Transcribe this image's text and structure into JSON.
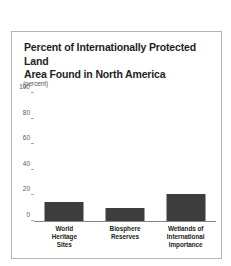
{
  "figure": {
    "title": "Percent of Internationally Protected Land\nArea Found in North America",
    "unit_label": "(percent)",
    "border_color": "#b4b4b4",
    "background_color": "#ffffff"
  },
  "chart_data": {
    "type": "bar",
    "title": "Percent of Internationally Protected Land Area Found in North America",
    "xlabel": "",
    "ylabel": "(percent)",
    "ylim": [
      0,
      100
    ],
    "yticks": [
      0,
      20,
      40,
      60,
      80,
      100
    ],
    "ytick_labels": [
      "0",
      "20",
      "40",
      "60",
      "80",
      "100"
    ],
    "grid": false,
    "legend": false,
    "bar_color": "#3d3d3d",
    "axis_color": "#808285",
    "categories": [
      "World\nHeritage\nSites",
      "Biosphere\nReserves",
      "Wetlands of\nInternational\nImportance"
    ],
    "category_names": [
      "World Heritage Sites",
      "Biosphere Reserves",
      "Wetlands of International Importance"
    ],
    "values": [
      15,
      10,
      21
    ]
  }
}
